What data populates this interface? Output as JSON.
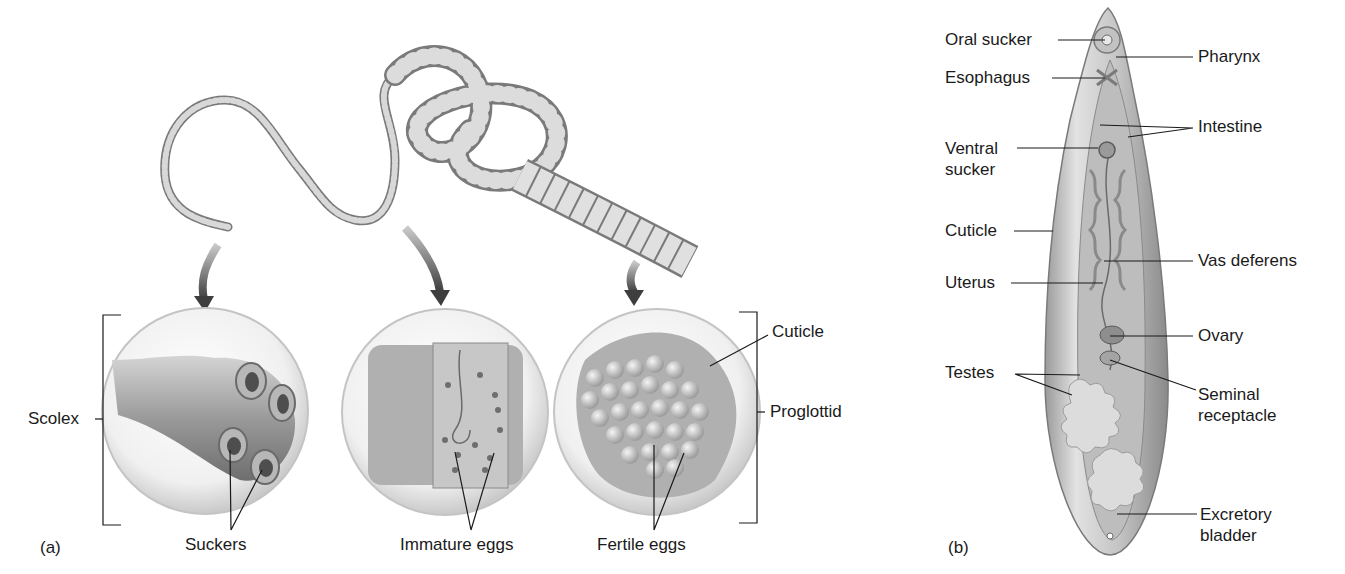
{
  "figure": {
    "panels": [
      {
        "id": "a",
        "tag": "(a)",
        "subject": "tapeworm",
        "labels": {
          "scolex": "Scolex",
          "suckers": "Suckers",
          "immature_eggs": "Immature eggs",
          "fertile_eggs": "Fertile eggs",
          "cuticle": "Cuticle",
          "proglottid": "Proglottid"
        }
      },
      {
        "id": "b",
        "tag": "(b)",
        "subject": "fluke",
        "labels": {
          "oral_sucker": "Oral sucker",
          "pharynx": "Pharynx",
          "esophagus": "Esophagus",
          "intestine": "Intestine",
          "ventral_sucker": "Ventral\nsucker",
          "cuticle": "Cuticle",
          "vas_deferens": "Vas deferens",
          "uterus": "Uterus",
          "ovary": "Ovary",
          "testes": "Testes",
          "seminal_receptacle": "Seminal\nreceptacle",
          "excretory_bladder": "Excretory\nbladder"
        }
      }
    ],
    "colors": {
      "ink": "#1a1a1a",
      "body_light": "#e6e6e6",
      "body_mid": "#b5b5b5",
      "body_dark": "#7a7a7a",
      "arrow": "#5a5a5a"
    }
  }
}
